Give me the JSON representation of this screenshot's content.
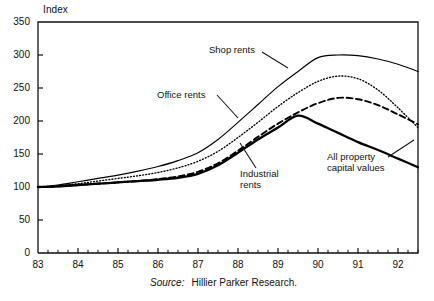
{
  "chart_data": {
    "type": "line",
    "title": "",
    "ylabel": "Index",
    "xlabel": "",
    "ylim": [
      0,
      350
    ],
    "xlim": [
      83,
      92.5
    ],
    "yticks": [
      0,
      50,
      100,
      150,
      200,
      250,
      300,
      350
    ],
    "xticks": [
      83,
      84,
      85,
      86,
      87,
      88,
      89,
      90,
      91,
      92
    ],
    "xtick_labels": [
      "83",
      "84",
      "85",
      "86",
      "87",
      "88",
      "89",
      "90",
      "91",
      "92"
    ],
    "ytick_labels": [
      "0",
      "50",
      "100",
      "150",
      "200",
      "250",
      "300",
      "350"
    ],
    "grid": false,
    "legend_position": "inline-annotations",
    "x": [
      83,
      83.5,
      84,
      84.5,
      85,
      85.5,
      86,
      86.5,
      87,
      87.5,
      88,
      88.5,
      89,
      89.5,
      90,
      90.5,
      91,
      91.5,
      92,
      92.5
    ],
    "series": [
      {
        "name": "Shop rents",
        "style": "thin-solid",
        "color": "#000000",
        "values": [
          100,
          103,
          108,
          113,
          118,
          124,
          131,
          140,
          152,
          172,
          198,
          225,
          252,
          275,
          296,
          300,
          299,
          294,
          286,
          275
        ]
      },
      {
        "name": "Office rents",
        "style": "dotted",
        "color": "#000000",
        "values": [
          100,
          102,
          105,
          109,
          113,
          117,
          122,
          129,
          139,
          154,
          175,
          198,
          222,
          243,
          260,
          268,
          264,
          247,
          220,
          190
        ]
      },
      {
        "name": "All property capital values",
        "style": "dashed",
        "color": "#000000",
        "values": [
          100,
          101,
          103,
          105,
          107,
          109,
          112,
          116,
          123,
          136,
          155,
          176,
          196,
          213,
          227,
          235,
          233,
          224,
          210,
          195
        ]
      },
      {
        "name": "Industrial rents",
        "style": "thick-solid",
        "color": "#000000",
        "values": [
          100,
          101,
          103,
          105,
          107,
          109,
          111,
          114,
          120,
          133,
          152,
          172,
          190,
          208,
          196,
          182,
          168,
          156,
          143,
          130
        ]
      }
    ],
    "annotations": [
      {
        "text": "Shop rents",
        "series": "Shop rents"
      },
      {
        "text": "Office rents",
        "series": "Office rents"
      },
      {
        "text": "Industrial\nrents",
        "series": "Industrial rents"
      },
      {
        "text": "All property\ncapital values",
        "series": "All property capital values"
      }
    ]
  },
  "source": {
    "keyword": "Source:",
    "text": "Hillier Parker Research."
  }
}
